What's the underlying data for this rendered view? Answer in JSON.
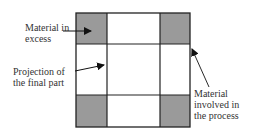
{
  "diagram": {
    "labels": {
      "excess": [
        "Material in",
        "excess"
      ],
      "projection": [
        "Projection of",
        "the final part"
      ],
      "process": [
        "Material",
        "involved in",
        "the process"
      ]
    },
    "colors": {
      "shaded": "#9a9a9a",
      "line": "#222222",
      "background": "#ffffff"
    },
    "grid": {
      "columns": 3,
      "rows": 3,
      "shaded_cells": [
        "top-left",
        "top-right",
        "bottom-left",
        "bottom-right"
      ]
    }
  }
}
